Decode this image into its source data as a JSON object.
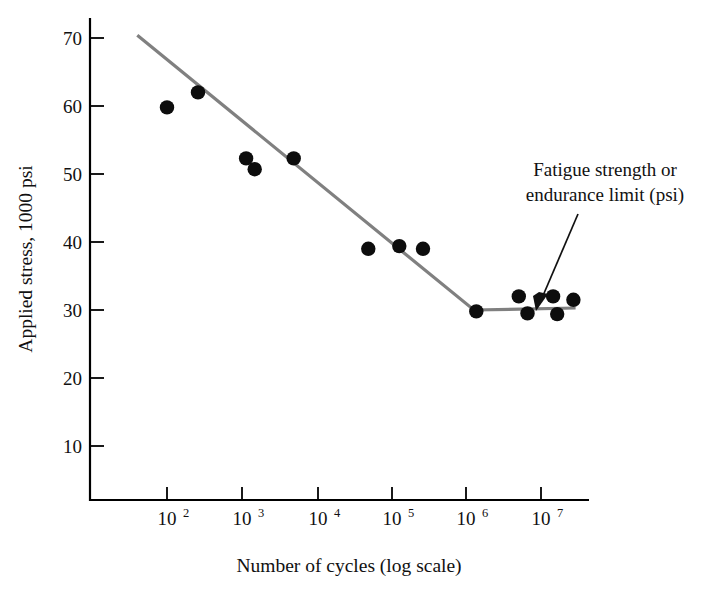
{
  "chart_data": {
    "type": "scatter",
    "title": "",
    "xlabel": "Number of cycles (log scale)",
    "ylabel": "Applied stress, 1000 psi",
    "xscale": "log",
    "yscale": "linear",
    "xlim": [
      30,
      30000000
    ],
    "ylim": [
      0,
      76
    ],
    "grid": false,
    "legend": null,
    "x_ticks": [
      {
        "value": 100,
        "label": "10",
        "exponent": "2"
      },
      {
        "value": 1000,
        "label": "10",
        "exponent": "3"
      },
      {
        "value": 10000,
        "label": "10",
        "exponent": "4"
      },
      {
        "value": 100000,
        "label": "10",
        "exponent": "5"
      },
      {
        "value": 1000000,
        "label": "10",
        "exponent": "6"
      },
      {
        "value": 10000000,
        "label": "10",
        "exponent": "7"
      }
    ],
    "y_ticks": [
      {
        "value": 10,
        "label": "10"
      },
      {
        "value": 20,
        "label": "20"
      },
      {
        "value": 30,
        "label": "30"
      },
      {
        "value": 40,
        "label": "40"
      },
      {
        "value": 50,
        "label": "50"
      },
      {
        "value": 60,
        "label": "60"
      },
      {
        "value": 70,
        "label": "70"
      }
    ],
    "series": [
      {
        "name": "S-N data points",
        "marker": "filled-circle",
        "color": "#0d0d0d",
        "points": [
          {
            "x": 100,
            "y": 59.8
          },
          {
            "x": 260,
            "y": 62.0
          },
          {
            "x": 1150,
            "y": 52.3
          },
          {
            "x": 1500,
            "y": 50.7
          },
          {
            "x": 5000,
            "y": 52.3
          },
          {
            "x": 50000,
            "y": 39.0
          },
          {
            "x": 130000,
            "y": 39.4
          },
          {
            "x": 270000,
            "y": 39.0
          },
          {
            "x": 1400000,
            "y": 29.8
          },
          {
            "x": 5200000,
            "y": 32.0
          },
          {
            "x": 6800000,
            "y": 29.5
          },
          {
            "x": 15000000,
            "y": 32.0
          },
          {
            "x": 17000000,
            "y": 29.4
          },
          {
            "x": 28000000,
            "y": 31.5
          }
        ]
      }
    ],
    "fit_line": {
      "name": "S-N curve fit",
      "color": "#808080",
      "points": [
        {
          "x": 40,
          "y": 70.4
        },
        {
          "x": 1300000,
          "y": 30.0
        },
        {
          "x": 30000000,
          "y": 30.3
        }
      ]
    },
    "annotations": [
      {
        "name": "endurance-limit-callout",
        "line1": "Fatigue strength or",
        "line2": "endurance limit (psi)",
        "points_to": {
          "x": 3000000,
          "y": 30.3
        }
      }
    ]
  }
}
